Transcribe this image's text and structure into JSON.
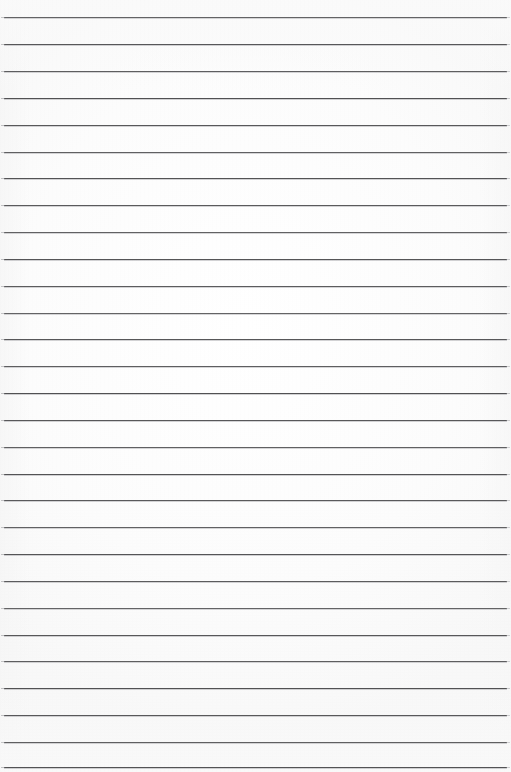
{
  "document": {
    "kind": "scanned-blank-ruled-paper",
    "title": "Blank ruled notebook page",
    "written_text": "",
    "page_width": 511,
    "page_height": 772
  },
  "colors": {
    "paper_background": "#fdfdfd",
    "rule_line": "#4b4b4d",
    "rule_line_shadow": "#787880",
    "page_edge_shade": "#f6f6f6"
  },
  "ruling": {
    "style": "horizontal-ruled",
    "line_count": 28,
    "first_line_y": 17,
    "line_spacing": 26.8,
    "line_thickness": 1,
    "line_left_x": 4,
    "line_right_x": 507,
    "margin_rule": "none",
    "line_positions_y": [
      17,
      44,
      71,
      98,
      125,
      152,
      178,
      205,
      232,
      259,
      286,
      313,
      339,
      366,
      393,
      420,
      447,
      474,
      500,
      527,
      554,
      581,
      608,
      635,
      661,
      688,
      715,
      742,
      767
    ]
  }
}
